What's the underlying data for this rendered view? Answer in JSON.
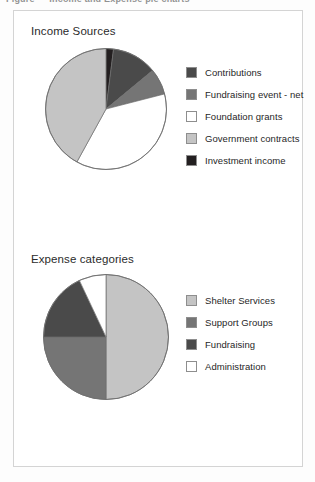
{
  "header_strip": {
    "text": "Figure — Income and Expense pie charts"
  },
  "panel": {
    "border_color": "#d4d4d4",
    "background": "#ffffff"
  },
  "palette": {
    "near_black": "#231f20",
    "dark_gray": "#4a4a4a",
    "medium_gray": "#757575",
    "light_gray": "#c4c4c4",
    "white": "#ffffff",
    "outline": "#6f6f6f",
    "swatch_border": "#8e8e8e",
    "text": "#1f1f1f",
    "title_text": "#2b2b2b"
  },
  "charts": [
    {
      "id": "income",
      "title": "Income Sources",
      "legend": [
        {
          "label": "Contributions",
          "color": "#4a4a4a"
        },
        {
          "label": "Fundraising event - net",
          "color": "#757575"
        },
        {
          "label": "Foundation grants",
          "color": "#ffffff"
        },
        {
          "label": "Government contracts",
          "color": "#c4c4c4"
        },
        {
          "label": "Investment income",
          "color": "#231f20"
        }
      ]
    },
    {
      "id": "expense",
      "title": "Expense categories",
      "legend": [
        {
          "label": "Shelter Services",
          "color": "#c4c4c4"
        },
        {
          "label": "Support Groups",
          "color": "#757575"
        },
        {
          "label": "Fundraising",
          "color": "#4a4a4a"
        },
        {
          "label": "Administration",
          "color": "#ffffff"
        }
      ]
    }
  ],
  "chart_data": [
    {
      "type": "pie",
      "title": "Income Sources",
      "categories": [
        "Investment income",
        "Contributions",
        "Fundraising event - net",
        "Foundation grants",
        "Government contracts"
      ],
      "values": [
        2,
        12,
        7,
        37,
        42
      ],
      "units": "percent",
      "colors": [
        "#231f20",
        "#4a4a4a",
        "#757575",
        "#ffffff",
        "#c4c4c4"
      ],
      "start_angle_deg": 0,
      "direction": "clockwise",
      "legend_position": "right",
      "grid": false,
      "xlabel": "",
      "ylabel": ""
    },
    {
      "type": "pie",
      "title": "Expense categories",
      "categories": [
        "Shelter Services",
        "Support Groups",
        "Fundraising",
        "Administration"
      ],
      "values": [
        50,
        25,
        18,
        7
      ],
      "units": "percent",
      "colors": [
        "#c4c4c4",
        "#757575",
        "#4a4a4a",
        "#ffffff"
      ],
      "start_angle_deg": 0,
      "direction": "clockwise",
      "legend_position": "right",
      "grid": false,
      "xlabel": "",
      "ylabel": ""
    }
  ]
}
